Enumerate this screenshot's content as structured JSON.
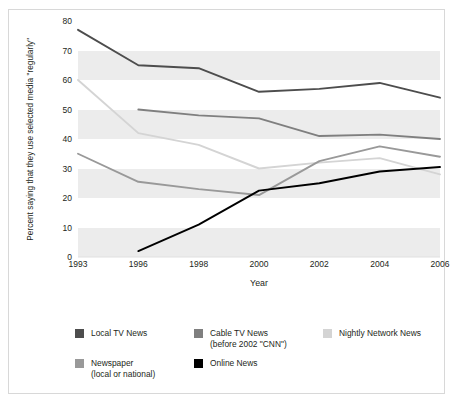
{
  "chart_data": {
    "type": "line",
    "title": "",
    "xlabel": "Year",
    "ylabel": "Percent saying that they use\nselected media \"regularly\"",
    "categories": [
      "1993",
      "1996",
      "1998",
      "2000",
      "2002",
      "2004",
      "2006"
    ],
    "ylim": [
      0,
      80
    ],
    "yticks": [
      0,
      10,
      20,
      30,
      40,
      50,
      60,
      70,
      80
    ],
    "grid": "horizontal-bands",
    "legend_position": "below",
    "series": [
      {
        "name": "Local TV News",
        "color": "#4d4d4d",
        "values": [
          77,
          65,
          64,
          56,
          57,
          59,
          54
        ]
      },
      {
        "name": "Cable TV News\n(before 2002 \"CNN\")",
        "color": "#7f7f7f",
        "values": [
          null,
          50,
          48,
          47,
          41,
          41.5,
          40
        ]
      },
      {
        "name": "Nightly Network News",
        "color": "#d4d4d4",
        "values": [
          60,
          42,
          38,
          30,
          32,
          33.5,
          28
        ]
      },
      {
        "name": "Newspaper\n(local or national)",
        "color": "#999999",
        "values": [
          35,
          25.5,
          23,
          21,
          32.5,
          37.5,
          34
        ]
      },
      {
        "name": "Online News",
        "color": "#000000",
        "values": [
          null,
          2,
          11,
          22.5,
          25,
          29,
          30.5
        ]
      }
    ]
  },
  "legend": {
    "items": [
      {
        "label": "Local TV News",
        "color": "#4d4d4d"
      },
      {
        "label": "Cable TV News\n(before 2002 \"CNN\")",
        "color": "#7f7f7f"
      },
      {
        "label": "Nightly Network News",
        "color": "#d4d4d4"
      },
      {
        "label": "Newspaper\n(local or national)",
        "color": "#999999"
      },
      {
        "label": "Online News",
        "color": "#000000"
      }
    ]
  }
}
